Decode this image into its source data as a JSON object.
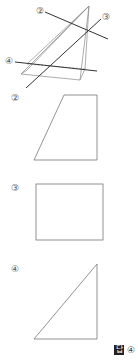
{
  "figure": {
    "lines": [
      {
        "label": "②",
        "x1": 45,
        "y1": 12,
        "x2": 108,
        "y2": 39
      },
      {
        "label": "③",
        "x1": 101,
        "y1": 19,
        "x2": 26,
        "y2": 88
      },
      {
        "label": "④",
        "x1": 15,
        "y1": 62,
        "x2": 97,
        "y2": 71
      }
    ],
    "line_color": "#333333",
    "edge_color": "#888888"
  },
  "options": [
    {
      "label": "②",
      "shape": "trapezoid"
    },
    {
      "label": "③",
      "shape": "rectangle"
    },
    {
      "label": "④",
      "shape": "right-triangle"
    }
  ],
  "answer": {
    "box_label": "답",
    "value": "④"
  }
}
